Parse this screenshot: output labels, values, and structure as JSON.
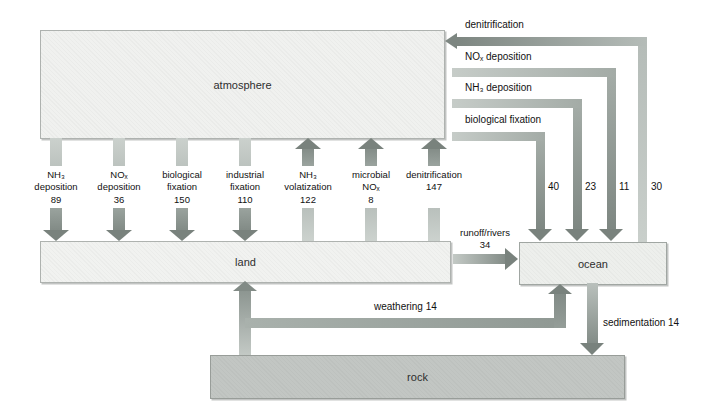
{
  "boxes": {
    "atmosphere": {
      "label": "atmosphere"
    },
    "land": {
      "label": "land"
    },
    "ocean": {
      "label": "ocean"
    },
    "rock": {
      "label": "rock"
    }
  },
  "land_fluxes": [
    {
      "lines": [
        "NH₃",
        "deposition",
        "89"
      ],
      "direction": "atmosphere-to-land"
    },
    {
      "lines": [
        "NOₓ",
        "deposition",
        "36"
      ],
      "direction": "atmosphere-to-land"
    },
    {
      "lines": [
        "biological",
        "fixation",
        "150"
      ],
      "direction": "atmosphere-to-land"
    },
    {
      "lines": [
        "industrial",
        "fixation",
        "110"
      ],
      "direction": "atmosphere-to-land"
    },
    {
      "lines": [
        "NH₃",
        "volatization",
        "122"
      ],
      "direction": "land-to-atmosphere"
    },
    {
      "lines": [
        "microbial",
        "NOₓ",
        "8"
      ],
      "direction": "land-to-atmosphere"
    },
    {
      "lines": [
        "",
        "denitrification",
        "147"
      ],
      "direction": "land-to-atmosphere"
    }
  ],
  "ocean_fluxes": [
    {
      "label": "denitrification",
      "value": "30",
      "direction": "ocean-to-atmosphere"
    },
    {
      "label": "NOₓ deposition",
      "value": "11",
      "direction": "atmosphere-to-ocean"
    },
    {
      "label": "NH₃ deposition",
      "value": "23",
      "direction": "atmosphere-to-ocean"
    },
    {
      "label": "biological fixation",
      "value": "40",
      "direction": "atmosphere-to-ocean"
    }
  ],
  "runoff": {
    "label": "runoff/rivers",
    "value": "34",
    "direction": "land-to-ocean"
  },
  "weathering": {
    "label": "weathering 14",
    "direction": "rock-to-land-and-ocean"
  },
  "sedimentation": {
    "label": "sedimentation 14",
    "direction": "ocean-to-rock"
  },
  "colors": {
    "arrow_light": "#c9cfcb",
    "arrow_dark": "#79827d",
    "box_light_fill": "#f0f1ef",
    "rock_fill": "#c2c6c3",
    "background": "#ffffff"
  }
}
